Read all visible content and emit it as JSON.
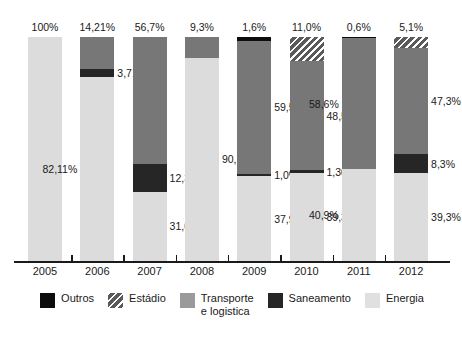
{
  "title": "",
  "chart_data": {
    "type": "bar",
    "subtype": "stacked-percent",
    "title": "",
    "xlabel": "",
    "ylabel": "",
    "ylim": [
      0,
      100
    ],
    "grid": false,
    "legend_position": "bottom",
    "categories": [
      "2005",
      "2006",
      "2007",
      "2008",
      "2009",
      "2010",
      "2011",
      "2012"
    ],
    "series": [
      {
        "name": "Outros",
        "key": "outros",
        "color": "#0d0d0d",
        "values": [
          null,
          null,
          null,
          null,
          1.6,
          null,
          0.6,
          null
        ],
        "labels": [
          "",
          "",
          "",
          "",
          "1,6%",
          "",
          "0,6%",
          ""
        ]
      },
      {
        "name": "Estádio",
        "key": "estadio",
        "color": "#9b9b9b",
        "values": [
          null,
          null,
          null,
          null,
          null,
          11.0,
          null,
          5.1
        ],
        "labels": [
          "",
          "",
          "",
          "",
          "",
          "11,0%",
          "",
          "5,1%"
        ]
      },
      {
        "name": "Transporte\ne logistica",
        "key": "transporte",
        "color": "#777777",
        "values": [
          null,
          14.21,
          56.7,
          9.3,
          59.5,
          48.5,
          58.6,
          47.3
        ],
        "labels": [
          "",
          "14,21%",
          "56,7%",
          "9,3%",
          "59,5%",
          "48,5%",
          "58,6%",
          "47,3%"
        ]
      },
      {
        "name": "Saneamento",
        "key": "saneamento",
        "color": "#262626",
        "values": [
          null,
          3.71,
          12.3,
          null,
          1.0,
          1.3,
          null,
          8.3
        ],
        "labels": [
          "",
          "3,71%",
          "12,3%",
          "",
          "1,0%",
          "1,30%",
          "",
          "8,3%"
        ]
      },
      {
        "name": "Energia",
        "key": "energia",
        "color": "#dcdcdc",
        "values": [
          100,
          82.11,
          31.0,
          90.7,
          37.9,
          39.3,
          40.9,
          39.3
        ],
        "labels": [
          "100%",
          "82,11%",
          "31,0%",
          "90,7%",
          "37,9%",
          "39,3%",
          "40,9%",
          "39,3%"
        ]
      }
    ],
    "bars": [
      {
        "year": "2005",
        "segments": [
          {
            "key": "energia",
            "value": 100,
            "label": "100%",
            "label_pos": "top"
          }
        ]
      },
      {
        "year": "2006",
        "segments": [
          {
            "key": "transporte",
            "value": 14.21,
            "label": "14,21%",
            "label_pos": "top"
          },
          {
            "key": "saneamento",
            "value": 3.71,
            "label": "3,71%",
            "label_pos": "right"
          },
          {
            "key": "energia",
            "value": 82.11,
            "label": "82,11%",
            "label_pos": "leftside"
          }
        ]
      },
      {
        "year": "2007",
        "segments": [
          {
            "key": "transporte",
            "value": 56.7,
            "label": "56,7%",
            "label_pos": "top"
          },
          {
            "key": "saneamento",
            "value": 12.3,
            "label": "12,3%",
            "label_pos": "right"
          },
          {
            "key": "energia",
            "value": 31.0,
            "label": "31,0%",
            "label_pos": "right"
          }
        ]
      },
      {
        "year": "2008",
        "segments": [
          {
            "key": "transporte",
            "value": 9.3,
            "label": "9,3%",
            "label_pos": "top"
          },
          {
            "key": "energia",
            "value": 90.7,
            "label": "90,7%",
            "label_pos": "right"
          }
        ]
      },
      {
        "year": "2009",
        "segments": [
          {
            "key": "outros",
            "value": 1.6,
            "label": "1,6%",
            "label_pos": "top"
          },
          {
            "key": "transporte",
            "value": 59.5,
            "label": "59,5%",
            "label_pos": "right"
          },
          {
            "key": "saneamento",
            "value": 1.0,
            "label": "1,0%",
            "label_pos": "right"
          },
          {
            "key": "energia",
            "value": 37.9,
            "label": "37,9%",
            "label_pos": "right"
          }
        ]
      },
      {
        "year": "2010",
        "segments": [
          {
            "key": "estadio",
            "value": 11.0,
            "label": "11,0%",
            "label_pos": "top"
          },
          {
            "key": "transporte",
            "value": 48.5,
            "label": "48,5%",
            "label_pos": "right"
          },
          {
            "key": "saneamento",
            "value": 1.3,
            "label": "1,30%",
            "label_pos": "right"
          },
          {
            "key": "energia",
            "value": 39.3,
            "label": "39,3%",
            "label_pos": "right"
          }
        ]
      },
      {
        "year": "2011",
        "segments": [
          {
            "key": "outros",
            "value": 0.6,
            "label": "0,6%",
            "label_pos": "top"
          },
          {
            "key": "transporte",
            "value": 58.6,
            "label": "58,6%",
            "label_pos": "leftside"
          },
          {
            "key": "energia",
            "value": 40.9,
            "label": "40,9%",
            "label_pos": "leftside"
          }
        ]
      },
      {
        "year": "2012",
        "segments": [
          {
            "key": "estadio",
            "value": 5.1,
            "label": "5,1%",
            "label_pos": "top"
          },
          {
            "key": "transporte",
            "value": 47.3,
            "label": "47,3%",
            "label_pos": "right"
          },
          {
            "key": "saneamento",
            "value": 8.3,
            "label": "8,3%",
            "label_pos": "right"
          },
          {
            "key": "energia",
            "value": 39.3,
            "label": "39,3%",
            "label_pos": "right"
          }
        ]
      }
    ],
    "legend": [
      {
        "key": "outros",
        "label": "Outros"
      },
      {
        "key": "estadio",
        "label": "Estádio"
      },
      {
        "key": "transporte",
        "label": "Transporte\ne logistica"
      },
      {
        "key": "saneamento",
        "label": "Saneamento"
      },
      {
        "key": "energia",
        "label": "Energia"
      }
    ]
  }
}
